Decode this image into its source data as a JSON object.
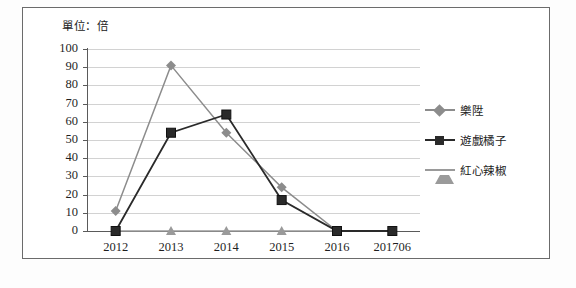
{
  "unit_label": "單位：倍",
  "colors": {
    "series_leshin": "#8c8c8c",
    "series_gamania": "#2a2a2a",
    "series_chili": "#9a9a9a",
    "gridline": "#d2d2d2",
    "axis": "#5a5a5a",
    "frame": "#6b6b6b",
    "background": "#ffffff"
  },
  "axis": {
    "y_ticks": [
      "100",
      "90",
      "80",
      "70",
      "60",
      "50",
      "40",
      "30",
      "20",
      "10",
      "0"
    ],
    "x_ticks": [
      "2012",
      "2013",
      "2014",
      "2015",
      "2016",
      "201706"
    ]
  },
  "legend": {
    "position": "right",
    "items": [
      {
        "label": "樂陞",
        "marker": "diamond-marker-icon",
        "color": "#8c8c8c"
      },
      {
        "label": "遊戲橘子",
        "marker": "square-marker-icon",
        "color": "#2a2a2a"
      },
      {
        "label": "紅心辣椒",
        "marker": "triangle-marker-icon",
        "color": "#9a9a9a"
      }
    ]
  },
  "caption": "",
  "chart_data": {
    "type": "line",
    "title": "",
    "subtitle": "",
    "xlabel": "",
    "ylabel": "單位：倍",
    "categories": [
      "2012",
      "2013",
      "2014",
      "2015",
      "2016",
      "201706"
    ],
    "ylim": [
      0,
      100
    ],
    "ytick_step": 10,
    "grid": true,
    "legend_position": "right",
    "series": [
      {
        "name": "樂陞",
        "marker": "diamond",
        "color": "#8c8c8c",
        "values": [
          11,
          91,
          54,
          24,
          0,
          0
        ]
      },
      {
        "name": "遊戲橘子",
        "marker": "square",
        "color": "#2a2a2a",
        "values": [
          0,
          54,
          64,
          17,
          0,
          0
        ]
      },
      {
        "name": "紅心辣椒",
        "marker": "triangle",
        "color": "#9a9a9a",
        "values": [
          0,
          0,
          0,
          0,
          0,
          0
        ]
      }
    ]
  }
}
